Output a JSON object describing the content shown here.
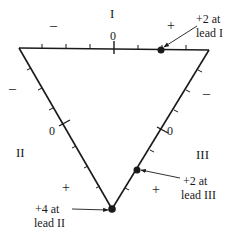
{
  "diagram": {
    "leads": [
      {
        "id": "I",
        "label": "I",
        "zero": "0",
        "neg_sign": "–",
        "pos_sign": "+"
      },
      {
        "id": "II",
        "label": "II",
        "zero": "0",
        "neg_sign": "–",
        "pos_sign": "+"
      },
      {
        "id": "III",
        "label": "III",
        "zero": "0",
        "neg_sign": "–",
        "pos_sign": "+"
      }
    ],
    "annotations": [
      {
        "id": "lead-I",
        "line1": "+2 at",
        "line2": "lead I",
        "value": 2
      },
      {
        "id": "lead-III",
        "line1": "+2 at",
        "line2": "lead III",
        "value": 2
      },
      {
        "id": "lead-II",
        "line1": "+4 at",
        "line2": "lead II",
        "value": 4
      }
    ],
    "colors": {
      "stroke": "#1a1a1a",
      "background": "#ffffff"
    }
  }
}
